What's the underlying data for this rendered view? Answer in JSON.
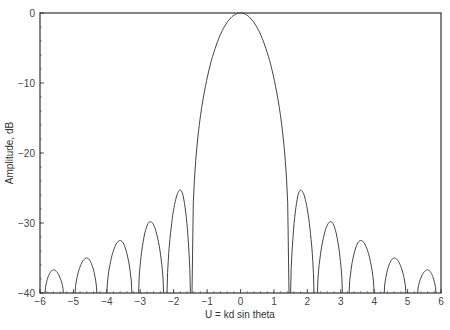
{
  "chart_data": {
    "type": "line",
    "title": "",
    "xlabel": "U = kd sin theta",
    "ylabel": "Amplitude, dB",
    "xlim": [
      -6,
      6
    ],
    "ylim": [
      -40,
      0
    ],
    "xticks": [
      -6,
      -5,
      -4,
      -3,
      -2,
      -1,
      0,
      1,
      2,
      3,
      4,
      5,
      6
    ],
    "yticks": [
      0,
      -10,
      -20,
      -30,
      -40
    ],
    "grid": false,
    "legend": null,
    "series": [
      {
        "name": "Array pattern",
        "main_lobe": {
          "null_left": -1.45,
          "peak_x": 0.0,
          "peak_y": 0.0,
          "null_right": 1.45
        },
        "sidelobes": [
          {
            "start": -5.85,
            "end": -5.3,
            "peak_x": -5.6,
            "peak_y": -36.7
          },
          {
            "start": -4.95,
            "end": -4.3,
            "peak_x": -4.6,
            "peak_y": -35.0
          },
          {
            "start": -4.0,
            "end": -3.25,
            "peak_x": -3.6,
            "peak_y": -32.5
          },
          {
            "start": -3.05,
            "end": -2.3,
            "peak_x": -2.7,
            "peak_y": -29.8
          },
          {
            "start": -2.2,
            "end": -1.5,
            "peak_x": -1.8,
            "peak_y": -25.3
          },
          {
            "start": 1.5,
            "end": 2.2,
            "peak_x": 1.8,
            "peak_y": -25.3
          },
          {
            "start": 2.3,
            "end": 3.05,
            "peak_x": 2.7,
            "peak_y": -29.8
          },
          {
            "start": 3.25,
            "end": 4.0,
            "peak_x": 3.6,
            "peak_y": -32.5
          },
          {
            "start": 4.3,
            "end": 4.95,
            "peak_x": 4.6,
            "peak_y": -35.0
          },
          {
            "start": 5.3,
            "end": 5.85,
            "peak_x": 5.6,
            "peak_y": -36.7
          }
        ]
      }
    ]
  },
  "colors": {
    "line": "#444444",
    "axis": "#333333"
  }
}
